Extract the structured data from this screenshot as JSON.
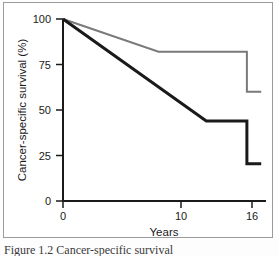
{
  "figure": {
    "background_color": "#ffffff",
    "frame_color": "#9a9a9a",
    "caption_clipped": "Figure 1.2  Cancer-specific survival"
  },
  "chart_data": {
    "type": "line",
    "title": "",
    "subtitle": "",
    "xlabel": "Years",
    "ylabel": "Cancer-specific survival (%)",
    "xlim": [
      0,
      17
    ],
    "ylim": [
      0,
      100
    ],
    "grid": false,
    "legend": "none",
    "xticks": [
      0,
      10,
      16
    ],
    "xtick_labels": [
      "0",
      "10",
      "16"
    ],
    "yticks": [
      0,
      25,
      50,
      75,
      100
    ],
    "ytick_labels": [
      "0",
      "25",
      "50",
      "75",
      "100"
    ],
    "series": [
      {
        "name": "upper-curve",
        "color": "#7a7a7a",
        "line_width": 2,
        "x": [
          0,
          8,
          15.4,
          15.4,
          16.6
        ],
        "y": [
          100,
          82,
          82,
          60,
          60
        ]
      },
      {
        "name": "lower-curve",
        "color": "#1a1a1a",
        "line_width": 3,
        "x": [
          0,
          12,
          15.4,
          15.4,
          16.6
        ],
        "y": [
          100,
          44,
          44,
          20.5,
          20.5
        ]
      }
    ],
    "axis_color": "#1a1a1a"
  }
}
